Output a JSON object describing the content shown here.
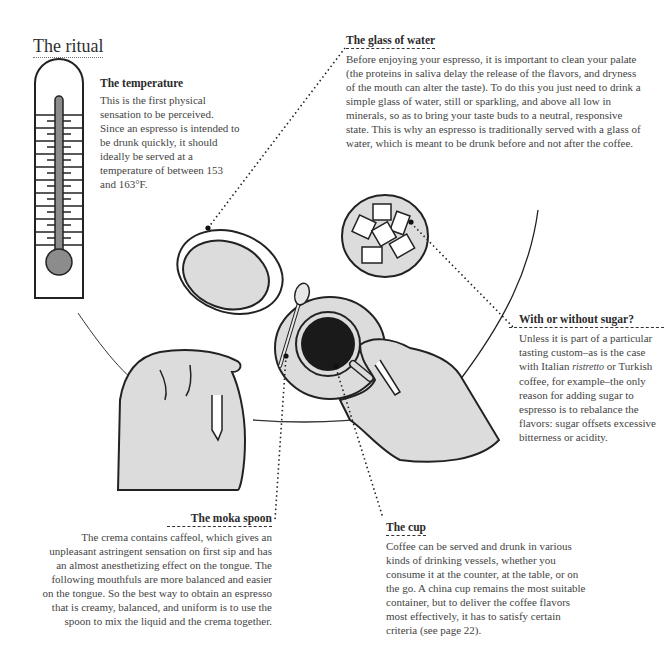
{
  "page": {
    "title": "The ritual"
  },
  "sections": {
    "temperature": {
      "heading": "The temperature",
      "body": "This is the first physical sensation to be perceived. Since an espresso is intended to be drunk quickly, it should ideally be served at a temperature of between 153 and 163°F."
    },
    "water": {
      "heading": "The glass of water",
      "body": "Before enjoying your espresso, it is important to clean your palate (the proteins in saliva delay the release of the flavors, and dryness of the mouth can alter the taste). To do this you just need to drink a simple glass of water, still or sparkling, and above all low in minerals, so as to bring your taste buds to a neutral, responsive state. This is why an espresso is traditionally served with a glass of water, which is meant to be drunk before and not after the coffee."
    },
    "sugar": {
      "heading": "With or without sugar?",
      "body_before": "Unless it is part of a particular tasting custom–as is the case with Italian ",
      "body_italic": "ristretto",
      "body_after": " or Turkish coffee, for example–the only reason for adding sugar to espresso is to rebalance the flavors: sugar offsets excessive bitterness or acidity."
    },
    "spoon": {
      "heading": "The moka spoon",
      "body": "The crema contains caffeol, which gives an unpleasant astringent sensation on first sip and has an almost anesthetizing effect on the tongue. The following mouthfuls are more balanced and easier on the tongue. So the best way to obtain an espresso that is creamy, balanced, and uniform is to use the spoon to mix the liquid and the crema together."
    },
    "cup": {
      "heading": "The cup",
      "body": "Coffee can be served and drunk in various kinds of drinking vessels, whether you consume it at the counter, at the table, or on the go. A china cup remains the most suitable container, but to deliver the coffee flavors most effectively, it has to satisfy certain criteria (see page 22)."
    }
  },
  "colors": {
    "ink": "#1e1e1e",
    "fill_light": "#dcdcdc",
    "fill_mid": "#8c8c8c",
    "coffee": "#1a1a1a"
  }
}
